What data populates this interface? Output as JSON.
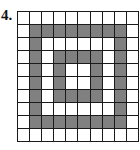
{
  "figure": {
    "label": "4.",
    "title": "4.",
    "colors": {
      "filled": "#808080",
      "empty": "#ffffff",
      "gridline": "#1a1a1a",
      "background": "#ffffff",
      "label_text": "#111111"
    }
  },
  "chart_data": {
    "type": "heatmap",
    "title": "4.",
    "subtitle": "",
    "xlabel": "",
    "ylabel": "",
    "rows": 10,
    "cols": 10,
    "grid": true,
    "legend": "none",
    "categories": [
      "1",
      "2",
      "3",
      "4",
      "5",
      "6",
      "7",
      "8",
      "9",
      "10"
    ],
    "row_labels": [
      "1",
      "2",
      "3",
      "4",
      "5",
      "6",
      "7",
      "8",
      "9",
      "10"
    ],
    "value_map": {
      "0": "empty",
      "1": "filled"
    },
    "values": [
      [
        0,
        0,
        0,
        0,
        0,
        0,
        0,
        0,
        0,
        0
      ],
      [
        0,
        1,
        1,
        1,
        1,
        1,
        1,
        1,
        1,
        0
      ],
      [
        0,
        1,
        0,
        0,
        0,
        0,
        0,
        0,
        1,
        0
      ],
      [
        0,
        1,
        0,
        1,
        1,
        1,
        1,
        0,
        1,
        0
      ],
      [
        0,
        1,
        0,
        1,
        0,
        0,
        1,
        0,
        1,
        0
      ],
      [
        0,
        1,
        0,
        1,
        0,
        0,
        1,
        0,
        1,
        0
      ],
      [
        0,
        1,
        0,
        1,
        1,
        1,
        1,
        0,
        1,
        0
      ],
      [
        0,
        1,
        0,
        0,
        0,
        0,
        0,
        0,
        1,
        0
      ],
      [
        0,
        1,
        1,
        1,
        1,
        1,
        1,
        1,
        1,
        0
      ],
      [
        0,
        0,
        0,
        0,
        0,
        0,
        0,
        0,
        0,
        0
      ]
    ],
    "filled_count": 40,
    "empty_count": 60
  }
}
